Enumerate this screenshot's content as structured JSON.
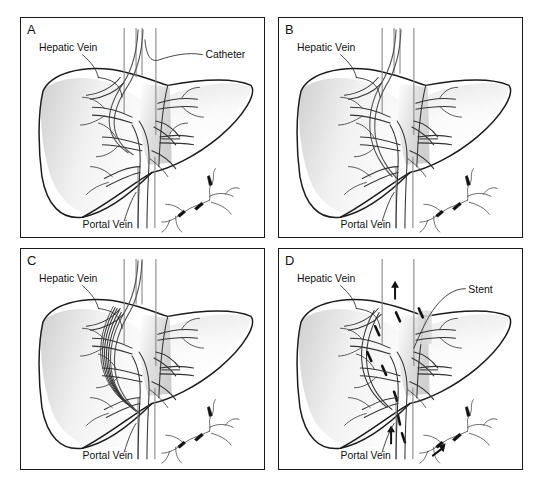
{
  "figure": {
    "background_color": "#ffffff",
    "border_color": "#1a1a1a",
    "label_color": "#111111"
  },
  "panels": [
    {
      "id": "A",
      "letter": "A",
      "name": "panel-a",
      "caption_labels": [
        {
          "text": "Hepatic Vein",
          "name": "label-hepatic-vein"
        },
        {
          "text": "Catheter",
          "name": "label-catheter"
        },
        {
          "text": "Portal Vein",
          "name": "label-portal-vein"
        }
      ],
      "stage": "catheter advanced into hepatic vein"
    },
    {
      "id": "B",
      "letter": "B",
      "name": "panel-b",
      "caption_labels": [
        {
          "text": "Hepatic Vein",
          "name": "label-hepatic-vein"
        },
        {
          "text": "Portal Vein",
          "name": "label-portal-vein"
        }
      ],
      "stage": "needle puncture from hepatic vein to portal vein"
    },
    {
      "id": "C",
      "letter": "C",
      "name": "panel-c",
      "caption_labels": [
        {
          "text": "Hepatic Vein",
          "name": "label-hepatic-vein"
        },
        {
          "text": "Portal Vein",
          "name": "label-portal-vein"
        }
      ],
      "stage": "balloon dilation of the parenchymal tract"
    },
    {
      "id": "D",
      "letter": "D",
      "name": "panel-d",
      "caption_labels": [
        {
          "text": "Hepatic Vein",
          "name": "label-hepatic-vein"
        },
        {
          "text": "Stent",
          "name": "label-stent"
        },
        {
          "text": "Portal Vein",
          "name": "label-portal-vein"
        }
      ],
      "stage": "stent deployed, flow arrows shown"
    }
  ],
  "colors": {
    "liver_outline": "#1b1b1b",
    "vessel": "#333333",
    "catheter": "#8c8c8c",
    "stent_marker": "#111111",
    "shading": "#d9d9d9"
  }
}
